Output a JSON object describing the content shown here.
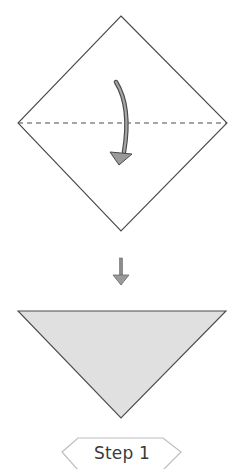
{
  "diagram": {
    "type": "origami-instruction",
    "step_label": "Step 1",
    "colors": {
      "outline": "#4a4a4a",
      "paper_front": "#ffffff",
      "paper_back": "#e0e0e0",
      "arrow_fill": "#9a9a9a",
      "arrow_stroke": "#4a4a4a",
      "label_border": "#bdbdbd",
      "label_text": "#3a3a3a"
    },
    "elements": [
      {
        "name": "square-paper",
        "shape": "diamond",
        "points": [
          [
            121,
            16
          ],
          [
            227,
            123
          ],
          [
            121,
            231
          ],
          [
            18,
            123
          ]
        ]
      },
      {
        "name": "valley-fold-line",
        "style": "dashed",
        "from": [
          18,
          123
        ],
        "to": [
          227,
          123
        ]
      },
      {
        "name": "fold-arrow",
        "direction": "down",
        "meaning": "fold top corner down to bottom corner"
      },
      {
        "name": "transition-arrow",
        "direction": "down"
      },
      {
        "name": "folded-triangle",
        "shape": "triangle",
        "points": [
          [
            18,
            311
          ],
          [
            226,
            311
          ],
          [
            121,
            418
          ]
        ]
      }
    ]
  }
}
